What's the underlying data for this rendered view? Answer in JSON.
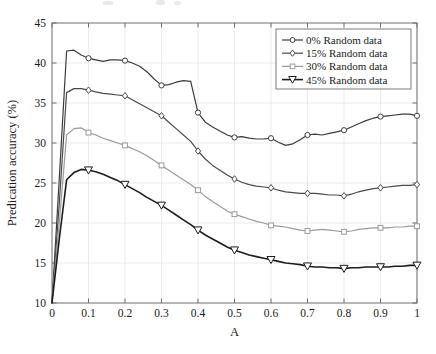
{
  "chart_data": {
    "type": "line",
    "title": "",
    "xlabel": "A",
    "ylabel": "Predication accuracy (%)",
    "xlim": [
      0,
      1
    ],
    "ylim": [
      10,
      45
    ],
    "xticks": [
      0,
      0.1,
      0.2,
      0.3,
      0.4,
      0.5,
      0.6,
      0.7,
      0.8,
      0.9,
      1
    ],
    "xticklabels": [
      "0",
      "0.1",
      "0.2",
      "0.3",
      "0.4",
      "0.5",
      "0.6",
      "0.7",
      "0.8",
      "0.9",
      "1"
    ],
    "yticks": [
      10,
      15,
      20,
      25,
      30,
      35,
      40,
      45
    ],
    "yticklabels": [
      "10",
      "15",
      "20",
      "25",
      "30",
      "35",
      "40",
      "45"
    ],
    "grid": true,
    "legend_position": "top-right",
    "x": [
      0,
      0.02,
      0.04,
      0.06,
      0.08,
      0.1,
      0.12,
      0.14,
      0.16,
      0.18,
      0.2,
      0.22,
      0.24,
      0.26,
      0.28,
      0.3,
      0.32,
      0.34,
      0.36,
      0.38,
      0.4,
      0.42,
      0.44,
      0.46,
      0.48,
      0.5,
      0.52,
      0.54,
      0.56,
      0.58,
      0.6,
      0.62,
      0.64,
      0.66,
      0.68,
      0.7,
      0.72,
      0.74,
      0.76,
      0.78,
      0.8,
      0.82,
      0.84,
      0.86,
      0.88,
      0.9,
      0.92,
      0.94,
      0.96,
      0.98,
      1
    ],
    "series": [
      {
        "name": "0% Random data",
        "marker": "circle",
        "color": "#3c3c3c",
        "values": [
          10.0,
          25.6,
          41.5,
          41.6,
          41.0,
          40.6,
          40.4,
          40.2,
          40.4,
          40.4,
          40.3,
          40.0,
          39.6,
          38.9,
          38.0,
          37.2,
          37.3,
          37.6,
          37.8,
          37.7,
          33.8,
          32.6,
          32.0,
          31.5,
          31.0,
          30.7,
          30.8,
          30.6,
          30.5,
          30.5,
          30.6,
          30.1,
          29.7,
          29.9,
          30.4,
          31.0,
          31.1,
          31.0,
          31.2,
          31.4,
          31.6,
          32.0,
          32.4,
          32.8,
          33.1,
          33.3,
          33.4,
          33.5,
          33.6,
          33.6,
          33.4
        ]
      },
      {
        "name": "15% Random data",
        "marker": "diamond",
        "color": "#4a4a4a",
        "values": [
          10.0,
          22.5,
          36.3,
          36.8,
          36.8,
          36.6,
          36.4,
          36.2,
          36.1,
          36.0,
          35.9,
          35.4,
          34.9,
          34.4,
          33.9,
          33.4,
          32.6,
          31.8,
          31.0,
          30.2,
          29.0,
          28.0,
          27.2,
          26.6,
          26.0,
          25.5,
          25.1,
          24.8,
          24.6,
          24.5,
          24.4,
          24.1,
          23.9,
          23.8,
          23.7,
          23.7,
          23.7,
          23.6,
          23.5,
          23.5,
          23.4,
          23.6,
          23.9,
          24.1,
          24.3,
          24.4,
          24.5,
          24.6,
          24.7,
          24.7,
          24.8
        ]
      },
      {
        "name": "30% Random data",
        "marker": "square",
        "color": "#9a9a9a",
        "values": [
          10.0,
          20.0,
          31.0,
          31.8,
          31.9,
          31.3,
          31.0,
          30.6,
          30.3,
          30.0,
          29.7,
          29.3,
          28.9,
          28.4,
          27.8,
          27.2,
          26.6,
          26.0,
          25.4,
          24.8,
          24.1,
          23.3,
          22.7,
          22.1,
          21.5,
          21.1,
          20.8,
          20.5,
          20.2,
          20.0,
          19.7,
          19.6,
          19.5,
          19.3,
          19.1,
          19.0,
          19.1,
          19.2,
          19.1,
          19.0,
          18.9,
          19.0,
          19.2,
          19.3,
          19.4,
          19.4,
          19.4,
          19.5,
          19.5,
          19.6,
          19.6
        ]
      },
      {
        "name": "45% Random data",
        "marker": "triangle-down",
        "color": "#1c1c1c",
        "values": [
          10.0,
          18.0,
          25.4,
          26.3,
          26.7,
          26.6,
          26.4,
          26.1,
          25.7,
          25.3,
          24.8,
          24.3,
          23.8,
          23.2,
          22.7,
          22.2,
          21.6,
          21.0,
          20.4,
          19.8,
          19.1,
          18.5,
          18.0,
          17.5,
          17.0,
          16.6,
          16.3,
          16.0,
          15.8,
          15.6,
          15.4,
          15.2,
          15.0,
          14.9,
          14.8,
          14.6,
          14.5,
          14.5,
          14.4,
          14.4,
          14.3,
          14.4,
          14.4,
          14.5,
          14.5,
          14.5,
          14.5,
          14.6,
          14.6,
          14.7,
          14.7
        ]
      }
    ],
    "marker_x": [
      0.1,
      0.2,
      0.3,
      0.4,
      0.5,
      0.6,
      0.7,
      0.8,
      0.9,
      1
    ]
  }
}
